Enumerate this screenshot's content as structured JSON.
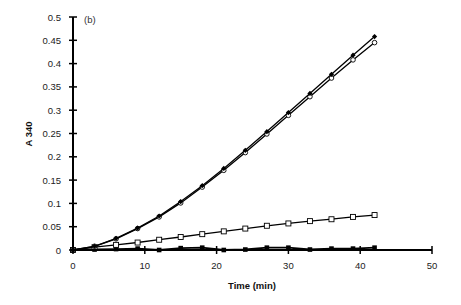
{
  "chart_data": {
    "type": "line",
    "title": "",
    "panel_label": "(b)",
    "xlabel": "Time (min)",
    "ylabel": "A 340",
    "xlim": [
      0,
      50
    ],
    "ylim": [
      0,
      0.5
    ],
    "x_ticks": [
      "0",
      "10",
      "20",
      "30",
      "40",
      "50"
    ],
    "y_ticks": [
      "0",
      "0.05",
      "0.1",
      "0.15",
      "0.2",
      "0.25",
      "0.3",
      "0.35",
      "0.4",
      "0.45",
      "0.5"
    ],
    "grid": false,
    "legend": "none",
    "x": [
      0,
      3,
      6,
      9,
      12,
      15,
      18,
      21,
      24,
      27,
      30,
      33,
      36,
      39,
      42
    ],
    "series": [
      {
        "name": "filled diamonds",
        "marker": "filled-diamond",
        "values": [
          0,
          0.008,
          0.025,
          0.047,
          0.073,
          0.104,
          0.138,
          0.175,
          0.214,
          0.254,
          0.295,
          0.336,
          0.377,
          0.418,
          0.458
        ]
      },
      {
        "name": "open circles",
        "marker": "open-circle",
        "values": [
          0,
          0.008,
          0.024,
          0.046,
          0.071,
          0.101,
          0.135,
          0.171,
          0.209,
          0.249,
          0.289,
          0.329,
          0.369,
          0.408,
          0.445
        ]
      },
      {
        "name": "open squares",
        "marker": "open-square",
        "values": [
          0,
          0.006,
          0.011,
          0.016,
          0.022,
          0.028,
          0.034,
          0.04,
          0.046,
          0.052,
          0.057,
          0.062,
          0.066,
          0.071,
          0.075
        ]
      },
      {
        "name": "filled squares",
        "marker": "filled-square",
        "values": [
          0,
          0.001,
          0.002,
          0.003,
          0.0,
          0.004,
          0.005,
          0.0,
          0.001,
          0.005,
          0.005,
          0.001,
          0.003,
          0.003,
          0.005
        ]
      }
    ]
  }
}
